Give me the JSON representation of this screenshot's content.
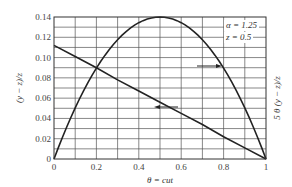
{
  "chart_data": {
    "type": "line",
    "title": "",
    "xlabel": "θ = cut",
    "ylabel": "(y − z)/z",
    "ylabel_right": "5 θ (y − z)/z",
    "xlim": [
      0,
      1
    ],
    "ylim": [
      0,
      0.14
    ],
    "x_ticks": [
      "0",
      "0.2",
      "0.4",
      "0.6",
      "0.8",
      "1"
    ],
    "y_ticks": [
      "0",
      "0.02",
      "0.04",
      "0.06",
      "0.08",
      "0.10",
      "0.12",
      "0.14"
    ],
    "grid": true,
    "annotations": [
      "α = 1.25",
      "z = 0.5"
    ],
    "series": [
      {
        "name": "(y − z)/z",
        "axis": "left",
        "x": [
          0,
          0.1,
          0.2,
          0.3,
          0.4,
          0.5,
          0.6,
          0.7,
          0.8,
          0.9,
          1.0
        ],
        "values": [
          0.112,
          0.101,
          0.09,
          0.078,
          0.067,
          0.056,
          0.045,
          0.034,
          0.022,
          0.011,
          0.0
        ]
      },
      {
        "name": "5 θ (y − z)/z",
        "axis": "right",
        "x": [
          0,
          0.1,
          0.2,
          0.3,
          0.4,
          0.5,
          0.6,
          0.7,
          0.8,
          0.9,
          1.0
        ],
        "values": [
          0.0,
          0.05,
          0.09,
          0.118,
          0.134,
          0.14,
          0.134,
          0.118,
          0.09,
          0.05,
          0.0
        ]
      }
    ]
  },
  "labels": {
    "alpha": "α = 1.25",
    "z": "z = 0.5",
    "xlabel": "θ = cut",
    "ylabel": "(y − z)/z",
    "ylabel_right": "5 θ (y − z)/z"
  }
}
